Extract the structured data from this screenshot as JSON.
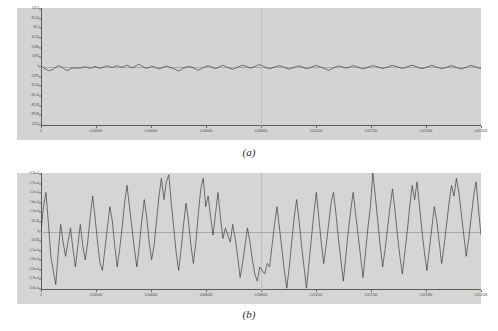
{
  "figure": {
    "name": "two-panel-noise-time-series",
    "subfigures": [
      {
        "caption": "(a)",
        "chart_data": {
          "type": "line",
          "title": "",
          "xlabel": "",
          "ylabel": "",
          "grid": false,
          "legend": "none",
          "zero_line": true,
          "xlim": [
            0,
            0.011508
          ],
          "ylim": [
            -113.4,
            113.4
          ],
          "ytick_labels": [
            "113.4",
            "85.05",
            "56.7",
            "31.15",
            "2.685",
            "1.875",
            "0",
            "-1.875",
            "-31.44",
            "-56.14",
            "-85.93",
            "-99.69",
            "-113.4"
          ],
          "xtick_labels": [
            "0",
            "0.002000",
            "0.004000",
            "0.006000",
            "0.008000",
            "0.011500",
            "0.017200",
            "0.017400",
            "0.011508"
          ],
          "series": [
            {
              "name": "signal-a",
              "values": [
                1.9,
                -1.2,
                -4.5,
                -6.6,
                -6.4,
                -4.1,
                -0.7,
                2.9,
                1.2,
                -2.0,
                -5.5,
                -6.8,
                -3.2,
                -1.6,
                -2.6,
                -1.2,
                -2.4,
                -0.6,
                0.3,
                -1.1,
                -2.4,
                -0.8,
                1.1,
                -0.6,
                -2.4,
                -1.0,
                1.0,
                2.4,
                0.9,
                -1.2,
                1.3,
                2.3,
                0.7,
                -0.5,
                1.5,
                3.6,
                1.2,
                -1.6,
                0.4,
                3.1,
                5.2,
                2.1,
                -0.9,
                -2.3,
                -1.0,
                1.6,
                0.1,
                -2.2,
                -3.5,
                -2.0,
                0.4,
                1.8,
                0.5,
                -1.6,
                -3.1,
                -5.4,
                -7.8,
                -5.1,
                -2.3,
                -0.4,
                1.1,
                0.2,
                -1.9,
                -4.2,
                -6.2,
                -3.8,
                -1.2,
                1.0,
                2.4,
                1.0,
                -1.4,
                -3.0,
                -1.2,
                1.6,
                3.3,
                1.4,
                -1.0,
                -2.8,
                -4.6,
                -2.6,
                -0.4,
                1.6,
                3.4,
                2.1,
                0.0,
                -2.0,
                -1.0,
                1.2,
                3.0,
                4.6,
                2.4,
                0.2,
                -1.8,
                -3.4,
                -2.0,
                -0.2,
                1.4,
                2.6,
                1.2,
                -0.8,
                -2.6,
                -4.2,
                -2.4,
                -0.6,
                1.2,
                2.0,
                0.6,
                -1.2,
                -3.2,
                -2.0,
                -0.4,
                1.6,
                3.2,
                1.4,
                -0.6,
                -2.4,
                -4.0,
                -6.4,
                -4.2,
                -1.8,
                0.4,
                2.0,
                1.0,
                -0.6,
                -2.2,
                -1.0,
                0.8,
                2.6,
                1.4,
                -0.4,
                -2.0,
                -3.6,
                -2.2,
                -0.6,
                1.2,
                2.8,
                1.6,
                0.2,
                -1.4,
                -3.0,
                -1.6,
                0.2,
                1.8,
                3.2,
                1.8,
                0.4,
                -1.2,
                -2.8,
                -1.4,
                0.4,
                2.0,
                3.4,
                1.8,
                0.2,
                -1.6,
                -3.2,
                -1.8,
                -0.2,
                1.6,
                3.0,
                1.4,
                -0.2,
                -1.8,
                -3.4,
                -2.0,
                -0.4,
                1.2,
                2.6,
                1.0,
                -0.8,
                -2.4,
                -4.0,
                -2.2,
                -0.4,
                1.4,
                3.0,
                1.6,
                0.0,
                -1.6,
                -3.2
              ]
            }
          ]
        }
      },
      {
        "caption": "(b)",
        "chart_data": {
          "type": "line",
          "title": "",
          "xlabel": "",
          "ylabel": "",
          "grid": false,
          "legend": "none",
          "zero_line": true,
          "xlim": [
            0,
            0.011508
          ],
          "ylim": [
            -33000,
            33000
          ],
          "ytick_labels": [
            "3.3e+4",
            "2.7e+4",
            "2.2e+4",
            "1.6e+4",
            "1.1e+4",
            "54.26",
            "0",
            "-54.26",
            "-1.1e+4",
            "-1.6e+4",
            "-2.2e+4",
            "-2.7e+4",
            "-3.3e+4"
          ],
          "xtick_labels": [
            "0",
            "0.002000",
            "0.004000",
            "0.006000",
            "0.008000",
            "0.011500",
            "0.017200",
            "0.017400",
            "0.011508"
          ],
          "series": [
            {
              "name": "signal-b",
              "values": [
                0,
                14000,
                22000,
                5000,
                -14000,
                -22000,
                -30000,
                -12000,
                4000,
                -6000,
                -14000,
                -6000,
                2000,
                -10000,
                -20000,
                -8000,
                4000,
                -8000,
                -16000,
                -6000,
                8000,
                20000,
                8000,
                -6000,
                -18000,
                -22000,
                -10000,
                2000,
                14000,
                6000,
                -8000,
                -20000,
                -10000,
                2000,
                16000,
                26000,
                14000,
                2000,
                -10000,
                -20000,
                -8000,
                6000,
                18000,
                8000,
                -6000,
                -16000,
                -8000,
                6000,
                20000,
                30000,
                18000,
                28000,
                32000,
                16000,
                2000,
                -12000,
                -22000,
                -10000,
                4000,
                16000,
                6000,
                -8000,
                -18000,
                -6000,
                10000,
                24000,
                30000,
                14000,
                20000,
                8000,
                -2000,
                10000,
                22000,
                8000,
                -4000,
                2000,
                -2000,
                -6000,
                4000,
                -4000,
                -14000,
                -26000,
                -18000,
                -8000,
                2000,
                -6000,
                -16000,
                -24000,
                -28000,
                -20000,
                -22000,
                -24000,
                -18000,
                -20000,
                -8000,
                4000,
                14000,
                2000,
                -10000,
                -22000,
                -32000,
                -20000,
                -6000,
                8000,
                18000,
                6000,
                -8000,
                -20000,
                -32000,
                -18000,
                -4000,
                10000,
                22000,
                8000,
                -6000,
                -18000,
                -8000,
                4000,
                16000,
                22000,
                10000,
                -4000,
                -16000,
                -28000,
                -14000,
                0,
                12000,
                22000,
                10000,
                -2000,
                -14000,
                -26000,
                -12000,
                2000,
                14000,
                33000,
                20000,
                6000,
                -8000,
                -20000,
                -10000,
                2000,
                14000,
                24000,
                12000,
                -2000,
                -14000,
                -24000,
                -12000,
                0,
                14000,
                26000,
                18000,
                28000,
                14000,
                0,
                -12000,
                -22000,
                -10000,
                2000,
                14000,
                6000,
                -6000,
                -18000,
                -8000,
                4000,
                16000,
                26000,
                20000,
                30000,
                22000,
                10000,
                -2000,
                -14000,
                -4000,
                8000,
                20000,
                28000,
                12000,
                -2000
              ]
            }
          ]
        }
      }
    ]
  }
}
